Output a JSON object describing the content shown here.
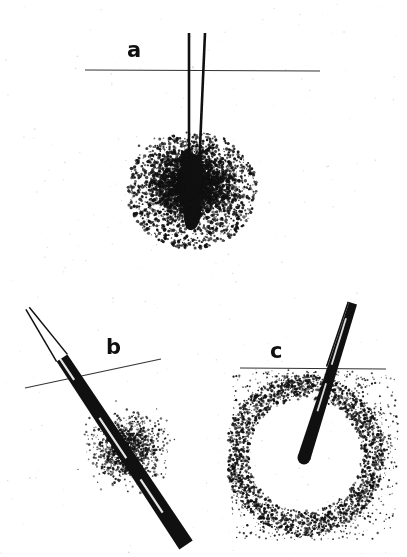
{
  "figure": {
    "background_color": "#ffffff",
    "ink_color": "#101010",
    "width": 407,
    "height": 557
  },
  "panels": [
    {
      "id": "a",
      "label": "a",
      "label_position": {
        "x": 127,
        "y": 40
      },
      "caption": "Perpendicular deep insertion with diffuse radial spread of injectate",
      "surface_line": {
        "x1": 85,
        "y1": 70,
        "x2": 320,
        "y2": 71
      },
      "needle": {
        "orientation": "vertical",
        "entry": {
          "x": 196,
          "y": 33
        },
        "tip": {
          "x": 193,
          "y": 222
        },
        "wall_left_top": {
          "x": 189,
          "y": 33
        },
        "wall_right_top": {
          "x": 205,
          "y": 33
        },
        "shaft_width_top": 16,
        "shaft_width_tip": 9
      },
      "depot": {
        "shape": "elongated-blob",
        "center": {
          "x": 192,
          "y": 190
        },
        "width": 22,
        "height": 80
      },
      "stipple_cloud": {
        "center": {
          "x": 192,
          "y": 185
        },
        "radius_x": 118,
        "radius_y": 98,
        "density": "high-center-fading-outward",
        "dot_count": 4200
      }
    },
    {
      "id": "b",
      "label": "b",
      "label_position": {
        "x": 106,
        "y": 337
      },
      "caption": "Oblique tangential insertion with injectate tracking along the needle path",
      "surface_line": {
        "x1": 25,
        "y1": 388,
        "x2": 161,
        "y2": 359
      },
      "needle": {
        "orientation": "oblique-down-right",
        "angle_degrees": 42,
        "entry": {
          "x": 28,
          "y": 308
        },
        "tip": {
          "x": 186,
          "y": 545
        },
        "hollow_section_end": {
          "x": 62,
          "y": 358
        },
        "shaft_width": 13
      },
      "stipple_cloud": {
        "center": {
          "x": 128,
          "y": 448
        },
        "radius_x": 92,
        "radius_y": 86,
        "density": "moderate-along-track",
        "dot_count": 1500
      }
    },
    {
      "id": "c",
      "label": "c",
      "label_position": {
        "x": 270,
        "y": 341
      },
      "caption": "Angled insertion producing a discrete intradermal bleb with dense peripheral ring",
      "surface_line": {
        "x1": 240,
        "y1": 368,
        "x2": 386,
        "y2": 369
      },
      "needle": {
        "orientation": "oblique-down-left",
        "angle_degrees": 72,
        "entry": {
          "x": 352,
          "y": 303
        },
        "tip": {
          "x": 304,
          "y": 458
        },
        "shaft_width": 11
      },
      "bleb": {
        "shape": "circle",
        "center": {
          "x": 305,
          "y": 455
        },
        "radius": 56,
        "fill": "#ffffff",
        "ring_thickness": 16
      },
      "stipple_cloud": {
        "center": {
          "x": 305,
          "y": 452
        },
        "radius_x": 88,
        "radius_y": 88,
        "density": "ring-concentrated",
        "dot_count": 3000
      }
    }
  ]
}
